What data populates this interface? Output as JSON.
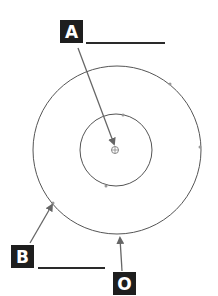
{
  "diagram": {
    "labels": [
      {
        "id": "A",
        "text": "A",
        "box": {
          "x": 60,
          "y": 20
        },
        "answer_line": {
          "x1": 86,
          "x2": 165,
          "y": 43
        },
        "arrow": {
          "x1": 78,
          "y1": 48,
          "x2": 114,
          "y2": 144
        },
        "points_to": "center point"
      },
      {
        "id": "B",
        "text": "B",
        "box": {
          "x": 11,
          "y": 245
        },
        "answer_line": {
          "x1": 38,
          "x2": 105,
          "y": 268
        },
        "arrow": {
          "x1": 30,
          "y1": 243,
          "x2": 52,
          "y2": 205
        },
        "points_to": "outer circle"
      },
      {
        "id": "O",
        "text": "O",
        "box": {
          "x": 113,
          "y": 272
        },
        "arrow": {
          "x1": 122,
          "y1": 271,
          "x2": 120,
          "y2": 238
        },
        "points_to": "outer circle"
      }
    ],
    "circles": [
      {
        "name": "outer-circle",
        "cx": 117,
        "cy": 150,
        "r": 84
      },
      {
        "name": "inner-circle",
        "cx": 116,
        "cy": 150,
        "r": 36
      }
    ],
    "center_marker": {
      "cx": 115,
      "cy": 150
    },
    "markers": [
      {
        "x": 170,
        "y": 84
      },
      {
        "x": 200,
        "y": 147
      },
      {
        "x": 53,
        "y": 203
      },
      {
        "x": 123,
        "y": 115
      },
      {
        "x": 106,
        "y": 186
      }
    ],
    "colors": {
      "stroke": "#555555",
      "arrow": "#666666",
      "label_bg": "#1e1e1e",
      "label_text": "#ffffff"
    }
  }
}
